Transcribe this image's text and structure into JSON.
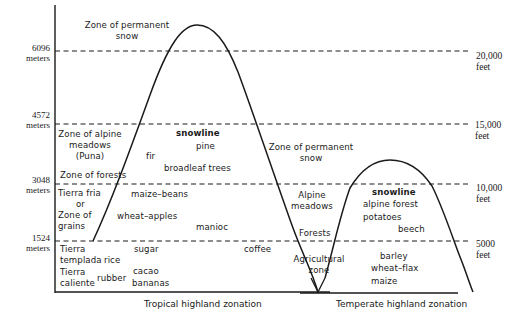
{
  "diagram": {
    "type": "altitudinal zonation diagram",
    "left_axis": {
      "unit": "meters",
      "ticks": [
        {
          "value": "6096",
          "unit": "meters"
        },
        {
          "value": "4572",
          "unit": "meters"
        },
        {
          "value": "3048",
          "unit": "meters"
        },
        {
          "value": "1524",
          "unit": "meters"
        }
      ]
    },
    "right_axis": {
      "unit": "feet",
      "ticks": [
        {
          "value": "20,000",
          "unit": "feet"
        },
        {
          "value": "15,000",
          "unit": "feet"
        },
        {
          "value": "10,000",
          "unit": "feet"
        },
        {
          "value": "5000",
          "unit": "feet"
        }
      ]
    },
    "tropical": {
      "caption": "Tropical highland zonation",
      "zones": {
        "permanent_snow": [
          "Zone of permanent",
          "snow"
        ],
        "alpine_meadows": [
          "Zone of alpine",
          "meadows",
          "(Puna)"
        ],
        "forests": "Zone of forests",
        "tierra_fria": [
          "Tierra fria",
          "or",
          "Zone of",
          "grains"
        ],
        "tierra_templada": [
          "Tierra",
          "templada"
        ],
        "tierra_caliente": [
          "Tierra",
          "caliente"
        ]
      },
      "crops": {
        "snowline": "snowline",
        "pine": "pine",
        "fir": "fir",
        "broadleaf": "broadleaf trees",
        "maize_beans": "maize–beans",
        "wheat_apples": "wheat–apples",
        "manioc": "manioc",
        "sugar": "sugar",
        "rice": "rice",
        "coffee": "coffee",
        "rubber": "rubber",
        "cacao": "cacao",
        "bananas": "bananas"
      }
    },
    "temperate": {
      "caption": "Temperate highland zonation",
      "zones": {
        "permanent_snow": [
          "Zone of permanent",
          "snow"
        ],
        "alpine_meadows": [
          "Alpine",
          "meadows"
        ],
        "forests": "Forests",
        "agricultural": [
          "Agricultural",
          "zone"
        ]
      },
      "crops": {
        "snowline": "snowline",
        "alpine_forest": "alpine forest",
        "potatoes": "potatoes",
        "beech": "beech",
        "barley": "barley",
        "wheat_flax": "wheat–flax",
        "maize": "maize"
      }
    }
  }
}
